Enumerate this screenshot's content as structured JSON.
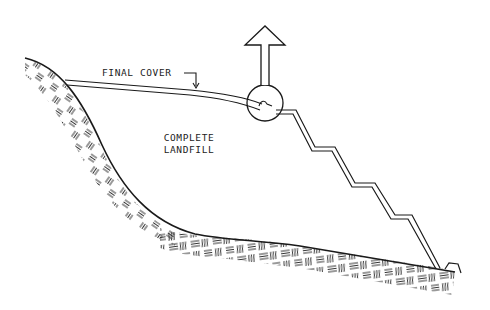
{
  "diagram": {
    "labels": {
      "final_cover": "FINAL COVER",
      "complete_line1": "COMPLETE",
      "complete_line2": "LANDFILL"
    },
    "colors": {
      "line": "#1a1a1a",
      "hatch": "#333333",
      "background": "#ffffff"
    },
    "elements": [
      "ground-surface-with-hatching",
      "final-cover-double-line",
      "stepped-side-slope",
      "detail-circle",
      "gas-vent-arrow",
      "toe-berm"
    ]
  }
}
